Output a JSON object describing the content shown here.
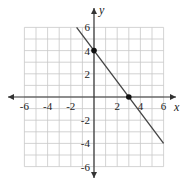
{
  "chart_data": {
    "type": "line",
    "title": "",
    "xlabel": "x",
    "ylabel": "y",
    "xlim": [
      -6,
      6
    ],
    "ylim": [
      -6,
      6
    ],
    "grid": true,
    "grid_step": 1,
    "x_ticks": [
      -6,
      -4,
      -2,
      2,
      4,
      6
    ],
    "y_ticks": [
      -6,
      -4,
      -2,
      2,
      4,
      6
    ],
    "x_tick_labels": [
      "-6",
      "-4",
      "-2",
      "2",
      "4",
      "6"
    ],
    "y_tick_labels": [
      "-6",
      "-4",
      "-2",
      "2",
      "4",
      "6"
    ],
    "series": [
      {
        "name": "line",
        "equation": "y = -4/3 x + 4",
        "slope": -1.333,
        "y_intercept": 4,
        "x_intercept": 3,
        "x": [
          -1.5,
          6
        ],
        "y": [
          6,
          -4
        ]
      }
    ],
    "points": [
      {
        "label": "y-intercept",
        "x": 0,
        "y": 4
      },
      {
        "label": "x-intercept",
        "x": 3,
        "y": 0
      }
    ],
    "colors": {
      "grid": "#c8c8c8",
      "axis": "#333333",
      "line": "#444444",
      "point": "#111111"
    }
  }
}
